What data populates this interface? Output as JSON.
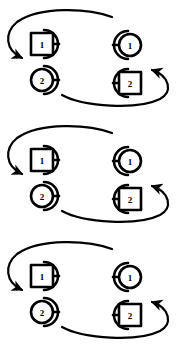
{
  "figure": {
    "panel_count": 3,
    "background_color": "#ffffff",
    "stroke_color": "#000000",
    "canvas": {
      "width": 177,
      "height": 348
    },
    "panel_size": {
      "width": 177,
      "height": 116
    }
  },
  "diagram_data": {
    "type": "diagram",
    "description": "Three identical panels, each showing two clusters of two self-looping states linked by a pair of large curved arrows",
    "panels": [
      {
        "index": 1,
        "label": "panel-1",
        "groups": [
          {
            "id": "left",
            "nodes": [
              {
                "id": "L1",
                "label": "1",
                "shape": "square",
                "self_loop": true,
                "cx": 42,
                "cy": 44
              },
              {
                "id": "L2",
                "label": "2",
                "shape": "circle",
                "self_loop": true,
                "cx": 42,
                "cy": 80
              }
            ]
          },
          {
            "id": "right",
            "nodes": [
              {
                "id": "R1",
                "label": "1",
                "shape": "circle",
                "self_loop": true,
                "cx": 130,
                "cy": 45
              },
              {
                "id": "R2",
                "label": "2",
                "shape": "square",
                "self_loop": true,
                "cx": 130,
                "cy": 83
              }
            ]
          }
        ],
        "connectors": [
          {
            "id": "top-arc",
            "from": "right",
            "to": "left",
            "direction": "right-to-left",
            "arrowhead": "left-group"
          },
          {
            "id": "bottom-arc",
            "from": "left",
            "to": "right",
            "direction": "left-to-right",
            "arrowhead": "right-group"
          }
        ]
      },
      {
        "index": 2,
        "label": "panel-2",
        "groups": [
          {
            "id": "left",
            "nodes": [
              {
                "id": "L1",
                "label": "1",
                "shape": "square",
                "self_loop": true,
                "cx": 42,
                "cy": 44
              },
              {
                "id": "L2",
                "label": "2",
                "shape": "circle",
                "self_loop": true,
                "cx": 42,
                "cy": 80
              }
            ]
          },
          {
            "id": "right",
            "nodes": [
              {
                "id": "R1",
                "label": "1",
                "shape": "circle",
                "self_loop": true,
                "cx": 130,
                "cy": 45
              },
              {
                "id": "R2",
                "label": "2",
                "shape": "square",
                "self_loop": true,
                "cx": 130,
                "cy": 83
              }
            ]
          }
        ],
        "connectors": [
          {
            "id": "top-arc",
            "from": "right",
            "to": "left",
            "direction": "right-to-left",
            "arrowhead": "left-group"
          },
          {
            "id": "bottom-arc",
            "from": "left",
            "to": "right",
            "direction": "left-to-right",
            "arrowhead": "right-group"
          }
        ]
      },
      {
        "index": 3,
        "label": "panel-3",
        "groups": [
          {
            "id": "left",
            "nodes": [
              {
                "id": "L1",
                "label": "1",
                "shape": "square",
                "self_loop": true,
                "cx": 42,
                "cy": 44
              },
              {
                "id": "L2",
                "label": "2",
                "shape": "circle",
                "self_loop": true,
                "cx": 42,
                "cy": 80
              }
            ]
          },
          {
            "id": "right",
            "nodes": [
              {
                "id": "R1",
                "label": "1",
                "shape": "circle",
                "self_loop": true,
                "cx": 130,
                "cy": 45
              },
              {
                "id": "R2",
                "label": "2",
                "shape": "square",
                "self_loop": true,
                "cx": 130,
                "cy": 83
              }
            ]
          }
        ],
        "connectors": [
          {
            "id": "top-arc",
            "from": "right",
            "to": "left",
            "direction": "right-to-left",
            "arrowhead": "left-group"
          },
          {
            "id": "bottom-arc",
            "from": "left",
            "to": "right",
            "direction": "left-to-right",
            "arrowhead": "right-group"
          }
        ]
      }
    ]
  }
}
